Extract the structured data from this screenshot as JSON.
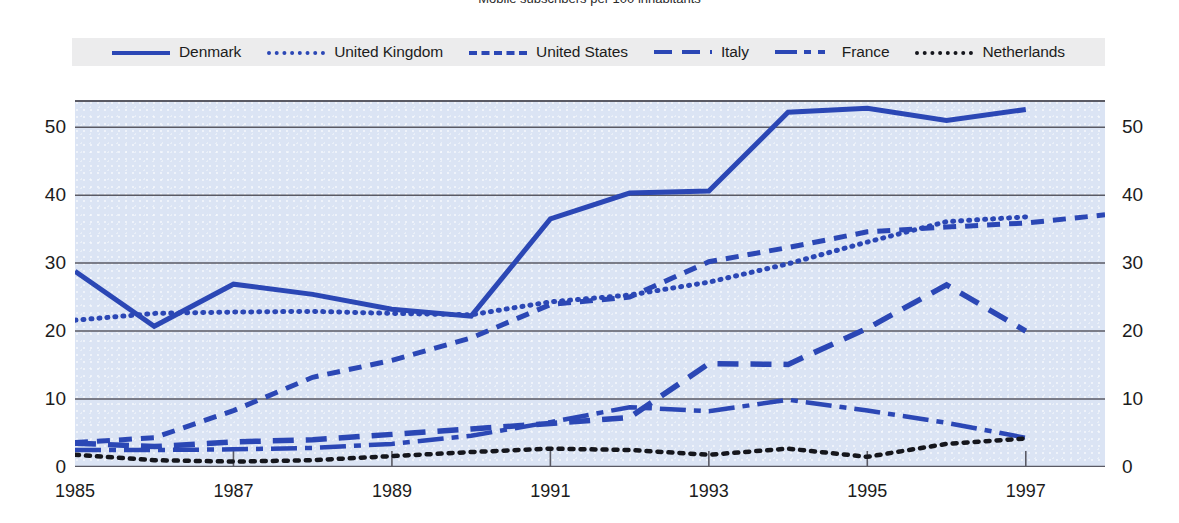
{
  "title": "Mobile subscribers per 100 inhabitants",
  "legend": {
    "position": "top",
    "items": [
      {
        "label": "Denmark",
        "style": "solid",
        "color": "#2b47b5",
        "icon": "line-solid-icon"
      },
      {
        "label": "United Kingdom",
        "style": "dotted",
        "color": "#2b47b5",
        "icon": "line-dotted-icon"
      },
      {
        "label": "United States",
        "style": "dashed",
        "color": "#2b47b5",
        "icon": "line-dashed-icon"
      },
      {
        "label": "Italy",
        "style": "longdash",
        "color": "#2b47b5",
        "icon": "line-longdash-icon"
      },
      {
        "label": "France",
        "style": "dashdot",
        "color": "#2b47b5",
        "icon": "line-dashdot-icon"
      },
      {
        "label": "Netherlands",
        "style": "blackdot",
        "color": "#15161c",
        "icon": "line-black-dotted-icon"
      }
    ]
  },
  "axes": {
    "y_ticks": [
      "0",
      "10",
      "20",
      "30",
      "40",
      "50"
    ],
    "x_ticks": [
      "1985",
      "1987",
      "1989",
      "1991",
      "1993",
      "1995",
      "1997"
    ],
    "ylim": [
      0,
      54
    ],
    "xlim": [
      1985,
      1998
    ],
    "grid": true,
    "plot_bg": "#dbe4f4",
    "legend_bg": "#ececed"
  },
  "chart_data": {
    "type": "line",
    "title": "Mobile subscribers per 100 inhabitants",
    "xlabel": "",
    "ylabel": "",
    "ylim": [
      0,
      54
    ],
    "xlim": [
      1985,
      1998
    ],
    "grid": true,
    "legend_position": "top",
    "x": [
      1985,
      1986,
      1987,
      1988,
      1989,
      1990,
      1991,
      1992,
      1993,
      1994,
      1995,
      1996,
      1997,
      1998
    ],
    "series": [
      {
        "name": "Denmark",
        "style": "solid",
        "color": "#2b47b5",
        "values": [
          28.8,
          20.7,
          26.9,
          25.4,
          23.2,
          22.2,
          36.5,
          40.3,
          40.6,
          52.2,
          52.8,
          51.0,
          52.6,
          null
        ]
      },
      {
        "name": "United Kingdom",
        "style": "dotted",
        "color": "#2b47b5",
        "values": [
          21.6,
          22.6,
          22.8,
          22.9,
          22.6,
          22.4,
          24.3,
          25.3,
          27.2,
          29.9,
          33.1,
          36.1,
          36.8,
          null
        ]
      },
      {
        "name": "United States",
        "style": "dashed",
        "color": "#2b47b5",
        "values": [
          3.6,
          4.3,
          8.3,
          13.2,
          15.7,
          19.0,
          23.9,
          25.0,
          30.2,
          32.3,
          34.6,
          35.3,
          35.9,
          37.1
        ]
      },
      {
        "name": "Italy",
        "style": "longdash",
        "color": "#2b47b5",
        "values": [
          3.5,
          3.0,
          3.7,
          4.0,
          4.8,
          5.6,
          6.4,
          7.3,
          15.2,
          15.1,
          20.4,
          26.8,
          20.0,
          null
        ]
      },
      {
        "name": "France",
        "style": "dashdot",
        "color": "#2b47b5",
        "values": [
          2.5,
          2.5,
          2.6,
          2.8,
          3.4,
          4.6,
          6.6,
          8.8,
          8.2,
          9.9,
          8.3,
          6.5,
          4.3,
          null
        ]
      },
      {
        "name": "Netherlands",
        "style": "blackdot",
        "color": "#15161c",
        "values": [
          1.8,
          1.0,
          0.8,
          1.0,
          1.6,
          2.2,
          2.7,
          2.5,
          1.8,
          2.7,
          1.5,
          3.4,
          4.2,
          null
        ]
      }
    ]
  }
}
